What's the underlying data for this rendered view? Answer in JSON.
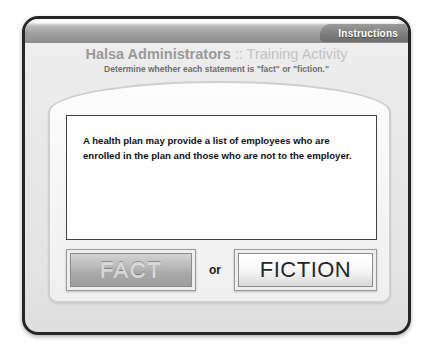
{
  "window": {
    "tab_label": "Instructions"
  },
  "header": {
    "title_strong": "Halsa Administrators",
    "title_light": " :: Training Activity",
    "subtitle": "Determine whether each statement is \"fact\" or \"fiction.\""
  },
  "activity": {
    "statement": "A health plan may provide a list of employees who are enrolled in the plan and those who are not to the employer.",
    "fact_label": "FACT",
    "separator_label": "or",
    "fiction_label": "FICTION"
  },
  "colors": {
    "frame_border": "#262626",
    "top_band": "#8e8e8e",
    "tab_background": "#7e7e7e",
    "tab_text": "#ffffff",
    "title_strong": "#9a9a9a",
    "title_light": "#c3c3c3",
    "subtitle": "#6e6e6e",
    "statement_text": "#111111",
    "fact_button": "#a9a9a9",
    "fiction_button": "#fbfbfb"
  }
}
